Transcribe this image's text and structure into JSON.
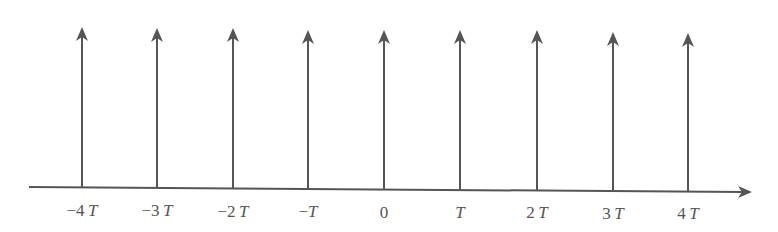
{
  "diagram": {
    "type": "impulse-train",
    "colors": {
      "stroke": "#555555",
      "background": "#ffffff"
    },
    "axis": {
      "x_start": 29,
      "y_start": 187,
      "x_end": 752,
      "y_end": 192,
      "direction": "right"
    },
    "impulses": [
      {
        "x": 82,
        "top": 27,
        "base": 188,
        "coef": "−4",
        "var": "T"
      },
      {
        "x": 157,
        "top": 28,
        "base": 188,
        "coef": "−3",
        "var": "T"
      },
      {
        "x": 233,
        "top": 28,
        "base": 189,
        "coef": "−2",
        "var": "T"
      },
      {
        "x": 308,
        "top": 30,
        "base": 189,
        "coef": "−",
        "var": "T"
      },
      {
        "x": 384,
        "top": 30,
        "base": 190,
        "coef": "0",
        "var": ""
      },
      {
        "x": 460,
        "top": 30,
        "base": 190,
        "coef": "",
        "var": "T"
      },
      {
        "x": 537,
        "top": 30,
        "base": 190,
        "coef": "2",
        "var": "T"
      },
      {
        "x": 613,
        "top": 32,
        "base": 191,
        "coef": "3",
        "var": "T"
      },
      {
        "x": 688,
        "top": 33,
        "base": 191,
        "coef": "4",
        "var": "T"
      }
    ],
    "labels_y": 201
  }
}
